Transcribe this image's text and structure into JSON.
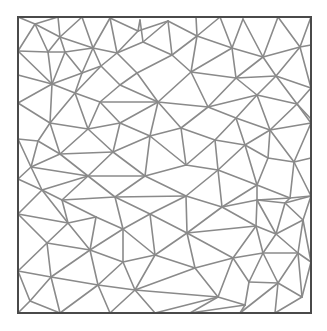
{
  "diagram": {
    "type": "triangular-mesh",
    "colors": {
      "edge": "#8a8a8a",
      "border": "#4a4a4a",
      "background": "#ffffff"
    },
    "border": {
      "x": 18,
      "y": 17,
      "width": 293,
      "height": 296
    },
    "vertices": [
      [
        18,
        17
      ],
      [
        35,
        24
      ],
      [
        58,
        17
      ],
      [
        82,
        17
      ],
      [
        110,
        18
      ],
      [
        140,
        20
      ],
      [
        168,
        21
      ],
      [
        196,
        17
      ],
      [
        220,
        17
      ],
      [
        243,
        19
      ],
      [
        278,
        17
      ],
      [
        311,
        17
      ],
      [
        60,
        37
      ],
      [
        48,
        52
      ],
      [
        65,
        52
      ],
      [
        93,
        48
      ],
      [
        117,
        53
      ],
      [
        138,
        31
      ],
      [
        143,
        42
      ],
      [
        172,
        55
      ],
      [
        197,
        36
      ],
      [
        232,
        48
      ],
      [
        263,
        57
      ],
      [
        300,
        47
      ],
      [
        311,
        45
      ],
      [
        18,
        51
      ],
      [
        18,
        75
      ],
      [
        82,
        73
      ],
      [
        101,
        66
      ],
      [
        137,
        73
      ],
      [
        120,
        85
      ],
      [
        191,
        72
      ],
      [
        236,
        78
      ],
      [
        276,
        76
      ],
      [
        311,
        88
      ],
      [
        52,
        84
      ],
      [
        75,
        93
      ],
      [
        18,
        103
      ],
      [
        100,
        102
      ],
      [
        158,
        102
      ],
      [
        208,
        107
      ],
      [
        257,
        95
      ],
      [
        297,
        104
      ],
      [
        311,
        119
      ],
      [
        50,
        123
      ],
      [
        88,
        129
      ],
      [
        120,
        123
      ],
      [
        150,
        136
      ],
      [
        181,
        128
      ],
      [
        236,
        118
      ],
      [
        270,
        130
      ],
      [
        311,
        123
      ],
      [
        18,
        139
      ],
      [
        38,
        141
      ],
      [
        60,
        154
      ],
      [
        113,
        152
      ],
      [
        186,
        165
      ],
      [
        215,
        140
      ],
      [
        245,
        145
      ],
      [
        268,
        158
      ],
      [
        294,
        162
      ],
      [
        311,
        158
      ],
      [
        31,
        167
      ],
      [
        88,
        176
      ],
      [
        145,
        176
      ],
      [
        218,
        170
      ],
      [
        257,
        185
      ],
      [
        290,
        198
      ],
      [
        311,
        196
      ],
      [
        18,
        179
      ],
      [
        42,
        190
      ],
      [
        62,
        200
      ],
      [
        115,
        197
      ],
      [
        186,
        196
      ],
      [
        222,
        207
      ],
      [
        257,
        200
      ],
      [
        285,
        203
      ],
      [
        18,
        214
      ],
      [
        68,
        223
      ],
      [
        96,
        217
      ],
      [
        150,
        214
      ],
      [
        123,
        229
      ],
      [
        187,
        233
      ],
      [
        256,
        226
      ],
      [
        276,
        234
      ],
      [
        303,
        220
      ],
      [
        47,
        243
      ],
      [
        90,
        250
      ],
      [
        155,
        255
      ],
      [
        123,
        262
      ],
      [
        195,
        268
      ],
      [
        233,
        258
      ],
      [
        263,
        253
      ],
      [
        298,
        253
      ],
      [
        311,
        262
      ],
      [
        18,
        271
      ],
      [
        51,
        277
      ],
      [
        98,
        285
      ],
      [
        135,
        290
      ],
      [
        218,
        297
      ],
      [
        249,
        282
      ],
      [
        278,
        283
      ],
      [
        302,
        297
      ],
      [
        311,
        300
      ],
      [
        30,
        301
      ],
      [
        245,
        305
      ],
      [
        18,
        313
      ],
      [
        60,
        313
      ],
      [
        110,
        313
      ],
      [
        155,
        313
      ],
      [
        190,
        313
      ],
      [
        240,
        313
      ],
      [
        275,
        313
      ],
      [
        311,
        313
      ]
    ],
    "edges": [
      [
        1,
        2
      ],
      [
        1,
        0
      ],
      [
        1,
        25
      ],
      [
        1,
        13
      ],
      [
        1,
        12
      ],
      [
        2,
        12
      ],
      [
        3,
        12
      ],
      [
        3,
        15
      ],
      [
        4,
        15
      ],
      [
        4,
        16
      ],
      [
        4,
        17
      ],
      [
        5,
        17
      ],
      [
        5,
        18
      ],
      [
        6,
        17
      ],
      [
        6,
        18
      ],
      [
        6,
        19
      ],
      [
        6,
        20
      ],
      [
        7,
        20
      ],
      [
        8,
        20
      ],
      [
        8,
        21
      ],
      [
        9,
        21
      ],
      [
        9,
        22
      ],
      [
        10,
        22
      ],
      [
        10,
        23
      ],
      [
        11,
        23
      ],
      [
        11,
        24
      ],
      [
        12,
        13
      ],
      [
        12,
        14
      ],
      [
        12,
        15
      ],
      [
        13,
        25
      ],
      [
        13,
        14
      ],
      [
        14,
        15
      ],
      [
        14,
        27
      ],
      [
        15,
        16
      ],
      [
        15,
        28
      ],
      [
        15,
        27
      ],
      [
        16,
        17
      ],
      [
        16,
        18
      ],
      [
        16,
        28
      ],
      [
        16,
        29
      ],
      [
        18,
        19
      ],
      [
        19,
        20
      ],
      [
        19,
        29
      ],
      [
        19,
        31
      ],
      [
        20,
        21
      ],
      [
        20,
        31
      ],
      [
        21,
        31
      ],
      [
        21,
        32
      ],
      [
        21,
        22
      ],
      [
        22,
        32
      ],
      [
        22,
        33
      ],
      [
        22,
        23
      ],
      [
        23,
        33
      ],
      [
        23,
        24
      ],
      [
        24,
        34
      ],
      [
        23,
        34
      ],
      [
        25,
        26
      ],
      [
        25,
        35
      ],
      [
        13,
        35
      ],
      [
        14,
        35
      ],
      [
        26,
        35
      ],
      [
        26,
        37
      ],
      [
        27,
        35
      ],
      [
        27,
        36
      ],
      [
        27,
        28
      ],
      [
        28,
        30
      ],
      [
        28,
        36
      ],
      [
        29,
        30
      ],
      [
        29,
        39
      ],
      [
        31,
        39
      ],
      [
        31,
        40
      ],
      [
        31,
        32
      ],
      [
        32,
        40
      ],
      [
        32,
        41
      ],
      [
        32,
        33
      ],
      [
        33,
        41
      ],
      [
        33,
        42
      ],
      [
        33,
        34
      ],
      [
        34,
        42
      ],
      [
        34,
        43
      ],
      [
        35,
        36
      ],
      [
        35,
        37
      ],
      [
        35,
        44
      ],
      [
        36,
        38
      ],
      [
        36,
        44
      ],
      [
        36,
        45
      ],
      [
        30,
        38
      ],
      [
        30,
        39
      ],
      [
        38,
        39
      ],
      [
        38,
        45
      ],
      [
        38,
        46
      ],
      [
        39,
        46
      ],
      [
        39,
        47
      ],
      [
        39,
        48
      ],
      [
        39,
        40
      ],
      [
        40,
        48
      ],
      [
        40,
        49
      ],
      [
        40,
        41
      ],
      [
        41,
        49
      ],
      [
        41,
        50
      ],
      [
        41,
        42
      ],
      [
        42,
        50
      ],
      [
        42,
        43
      ],
      [
        43,
        51
      ],
      [
        42,
        51
      ],
      [
        37,
        44
      ],
      [
        37,
        52
      ],
      [
        44,
        45
      ],
      [
        44,
        53
      ],
      [
        44,
        54
      ],
      [
        45,
        46
      ],
      [
        45,
        54
      ],
      [
        45,
        55
      ],
      [
        46,
        47
      ],
      [
        46,
        55
      ],
      [
        47,
        48
      ],
      [
        47,
        55
      ],
      [
        47,
        56
      ],
      [
        47,
        64
      ],
      [
        48,
        56
      ],
      [
        48,
        57
      ],
      [
        49,
        57
      ],
      [
        49,
        58
      ],
      [
        49,
        50
      ],
      [
        50,
        58
      ],
      [
        50,
        59
      ],
      [
        50,
        60
      ],
      [
        50,
        51
      ],
      [
        51,
        61
      ],
      [
        51,
        60
      ],
      [
        52,
        53
      ],
      [
        52,
        62
      ],
      [
        53,
        54
      ],
      [
        53,
        62
      ],
      [
        54,
        55
      ],
      [
        54,
        63
      ],
      [
        54,
        62
      ],
      [
        55,
        63
      ],
      [
        55,
        64
      ],
      [
        56,
        57
      ],
      [
        56,
        64
      ],
      [
        56,
        65
      ],
      [
        57,
        58
      ],
      [
        57,
        65
      ],
      [
        58,
        59
      ],
      [
        58,
        65
      ],
      [
        58,
        66
      ],
      [
        59,
        60
      ],
      [
        59,
        66
      ],
      [
        60,
        61
      ],
      [
        60,
        67
      ],
      [
        61,
        68
      ],
      [
        60,
        68
      ],
      [
        62,
        69
      ],
      [
        62,
        70
      ],
      [
        62,
        63
      ],
      [
        63,
        70
      ],
      [
        63,
        71
      ],
      [
        63,
        72
      ],
      [
        63,
        64
      ],
      [
        64,
        72
      ],
      [
        64,
        73
      ],
      [
        65,
        73
      ],
      [
        65,
        74
      ],
      [
        65,
        66
      ],
      [
        66,
        74
      ],
      [
        66,
        75
      ],
      [
        66,
        67
      ],
      [
        67,
        68
      ],
      [
        67,
        75
      ],
      [
        67,
        76
      ],
      [
        68,
        76
      ],
      [
        69,
        70
      ],
      [
        69,
        77
      ],
      [
        70,
        71
      ],
      [
        70,
        77
      ],
      [
        70,
        78
      ],
      [
        71,
        72
      ],
      [
        71,
        78
      ],
      [
        71,
        79
      ],
      [
        72,
        73
      ],
      [
        72,
        80
      ],
      [
        72,
        81
      ],
      [
        73,
        80
      ],
      [
        73,
        82
      ],
      [
        73,
        74
      ],
      [
        74,
        82
      ],
      [
        74,
        83
      ],
      [
        74,
        75
      ],
      [
        75,
        83
      ],
      [
        75,
        84
      ],
      [
        75,
        76
      ],
      [
        76,
        84
      ],
      [
        76,
        85
      ],
      [
        68,
        85
      ],
      [
        77,
        78
      ],
      [
        77,
        86
      ],
      [
        78,
        79
      ],
      [
        78,
        86
      ],
      [
        78,
        87
      ],
      [
        79,
        81
      ],
      [
        79,
        87
      ],
      [
        80,
        81
      ],
      [
        80,
        82
      ],
      [
        80,
        88
      ],
      [
        81,
        87
      ],
      [
        81,
        89
      ],
      [
        81,
        88
      ],
      [
        82,
        88
      ],
      [
        82,
        90
      ],
      [
        82,
        91
      ],
      [
        82,
        83
      ],
      [
        83,
        91
      ],
      [
        83,
        92
      ],
      [
        83,
        84
      ],
      [
        84,
        92
      ],
      [
        84,
        93
      ],
      [
        84,
        85
      ],
      [
        85,
        93
      ],
      [
        85,
        94
      ],
      [
        86,
        87
      ],
      [
        86,
        95
      ],
      [
        86,
        96
      ],
      [
        87,
        96
      ],
      [
        87,
        97
      ],
      [
        87,
        89
      ],
      [
        88,
        89
      ],
      [
        88,
        90
      ],
      [
        88,
        98
      ],
      [
        89,
        97
      ],
      [
        89,
        98
      ],
      [
        90,
        98
      ],
      [
        90,
        99
      ],
      [
        90,
        91
      ],
      [
        91,
        100
      ],
      [
        91,
        99
      ],
      [
        91,
        92
      ],
      [
        92,
        100
      ],
      [
        92,
        101
      ],
      [
        92,
        93
      ],
      [
        93,
        101
      ],
      [
        93,
        94
      ],
      [
        94,
        102
      ],
      [
        93,
        102
      ],
      [
        95,
        96
      ],
      [
        95,
        104
      ],
      [
        96,
        97
      ],
      [
        96,
        104
      ],
      [
        96,
        107
      ],
      [
        97,
        98
      ],
      [
        97,
        107
      ],
      [
        97,
        108
      ],
      [
        98,
        108
      ],
      [
        98,
        109
      ],
      [
        98,
        99
      ],
      [
        99,
        109
      ],
      [
        99,
        110
      ],
      [
        99,
        105
      ],
      [
        100,
        105
      ],
      [
        100,
        101
      ],
      [
        101,
        102
      ],
      [
        101,
        112
      ],
      [
        101,
        111
      ],
      [
        105,
        110
      ],
      [
        105,
        111
      ],
      [
        102,
        112
      ],
      [
        104,
        106
      ],
      [
        104,
        107
      ],
      [
        95,
        106
      ],
      [
        0,
        25
      ],
      [
        37,
        52
      ],
      [
        69,
        77
      ],
      [
        95,
        106
      ]
    ]
  }
}
